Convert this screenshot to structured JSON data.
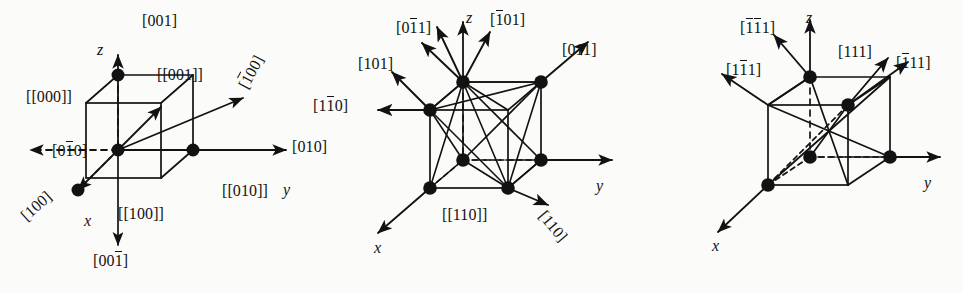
{
  "figure": {
    "background_color": "#fbfbf9",
    "ink_color": "#121212"
  },
  "panels": [
    {
      "id": "panel-a",
      "name": "cubic-100-directions",
      "axes": {
        "x": "x",
        "y": "y",
        "z": "z"
      },
      "labels": {
        "up": "[001]",
        "down_bar": "[00",
        "down_bar_over": "1",
        "down_tail": "]",
        "node_001": "[[001]]",
        "node_000": "[[000]]",
        "node_100": "[[100]]",
        "node_010": "[[010]]",
        "dir_0bar10_head": "[0",
        "dir_0bar10_over": "1",
        "dir_0bar10_tail": "0]",
        "dir_010": "[010]",
        "dir_100": "[100]",
        "dir_bar100_head": "[",
        "dir_bar100_over": "1",
        "dir_bar100_tail": "00]"
      }
    },
    {
      "id": "panel-b",
      "name": "cubic-110-directions",
      "axes": {
        "x": "x",
        "y": "y",
        "z": "z"
      },
      "labels": {
        "dir_0bar11_head": "[0",
        "dir_0bar11_over": "1",
        "dir_0bar11_tail": "1]",
        "dir_bar101_head": "[",
        "dir_bar101_over": "1",
        "dir_bar101_tail": "01]",
        "dir_011": "[011]",
        "dir_101": "[101]",
        "dir_1bar10_head": "[1",
        "dir_1bar10_over": "1",
        "dir_1bar10_tail": "0]",
        "dir_110": "[110]",
        "node_110": "[[110]]"
      }
    },
    {
      "id": "panel-c",
      "name": "cubic-111-directions",
      "axes": {
        "x": "x",
        "y": "y",
        "z": "z"
      },
      "labels": {
        "dir_bar1bar11_head": "[",
        "dir_bar1bar11_over1": "1",
        "dir_bar1bar11_over2": "1",
        "dir_bar1bar11_tail": "1]",
        "dir_1bar11_head": "[1",
        "dir_1bar11_over": "1",
        "dir_1bar11_tail": "1]",
        "dir_111": "[111]",
        "dir_bar111_head": "[",
        "dir_bar111_over": "1",
        "dir_bar111_tail": "11]"
      }
    }
  ]
}
